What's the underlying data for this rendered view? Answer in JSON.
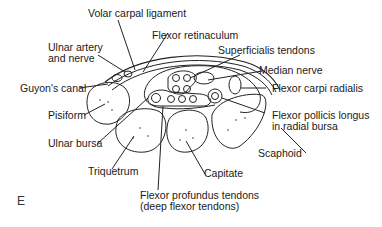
{
  "figure": {
    "panel_letter": "E",
    "labels": {
      "volar_carpal_ligament": "Volar carpal ligament",
      "flexor_retinaculum": "Flexor retinaculum",
      "ulnar_artery_nerve_1": "Ulnar artery",
      "ulnar_artery_nerve_2": "and nerve",
      "superficialis_tendons": "Superficialis tendons",
      "median_nerve": "Median nerve",
      "guyons_canal": "Guyon's canal",
      "flexor_carpi_radialis": "Flexor carpi radialis",
      "pisiform": "Pisiform",
      "flexor_pollicis_longus_1": "Flexor pollicis longus",
      "flexor_pollicis_longus_2": "in radial bursa",
      "ulnar_bursa": "Ulnar bursa",
      "scaphoid": "Scaphoid",
      "triquetrum": "Triquetrum",
      "capitate": "Capitate",
      "flexor_profundus_1": "Flexor profundus tendons",
      "flexor_profundus_2": "(deep flexor tendons)"
    },
    "colors": {
      "line": "#222222",
      "background": "#ffffff",
      "text": "#1a1a1a"
    }
  }
}
